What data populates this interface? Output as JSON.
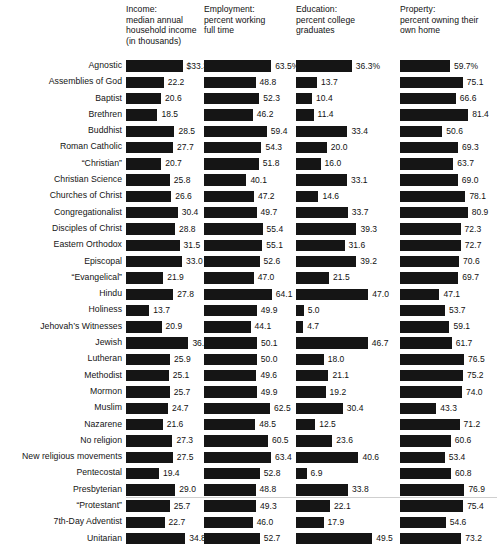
{
  "chart_data": {
    "type": "bar",
    "title": "",
    "subtitle": "",
    "orientation": "horizontal",
    "grid": false,
    "legend": false,
    "xlabel": "",
    "ylabel": "",
    "categories": [
      "Agnostic",
      "Assemblies of God",
      "Baptist",
      "Brethren",
      "Buddhist",
      "Roman Catholic",
      "“Christian”",
      "Christian Science",
      "Churches of Christ",
      "Congregationalist",
      "Disciples of Christ",
      "Eastern Orthodox",
      "Episcopal",
      "“Evangelical”",
      "Hindu",
      "Holiness",
      "Jehovah’s Witnesses",
      "Jewish",
      "Lutheran",
      "Methodist",
      "Mormon",
      "Muslim",
      "Nazarene",
      "No religion",
      "New religious movements",
      "Pentecostal",
      "Presbyterian",
      "“Protestant”",
      "7th-Day Adventist",
      "Unitarian"
    ],
    "panels": [
      {
        "key": "income",
        "header": "Income:\nmedian annual\nhousehold income\n(in thousands)",
        "header_lines": [
          "Income:",
          "median annual",
          "household income",
          "(in thousands)"
        ],
        "unit_prefix": "$",
        "axis_max": 40.0,
        "bar_px_max": 68,
        "labels": [
          "$33.3",
          "22.2",
          "20.6",
          "18.5",
          "28.5",
          "27.7",
          "20.7",
          "25.8",
          "26.6",
          "30.4",
          "28.8",
          "31.5",
          "33.0",
          "21.9",
          "27.8",
          "13.7",
          "20.9",
          "36.7",
          "25.9",
          "25.1",
          "25.7",
          "24.7",
          "21.6",
          "27.3",
          "27.5",
          "19.4",
          "29.0",
          "25.7",
          "22.7",
          "34.8"
        ],
        "values": [
          33.3,
          22.2,
          20.6,
          18.5,
          28.5,
          27.7,
          20.7,
          25.8,
          26.6,
          30.4,
          28.8,
          31.5,
          33.0,
          21.9,
          27.8,
          13.7,
          20.9,
          36.7,
          25.9,
          25.1,
          25.7,
          24.7,
          21.6,
          27.3,
          27.5,
          19.4,
          29.0,
          25.7,
          22.7,
          34.8
        ]
      },
      {
        "key": "employment",
        "header": "Employment:\npercent working\nfull time",
        "header_lines": [
          "Employment:",
          "percent working",
          "full time"
        ],
        "unit_prefix": "",
        "axis_max": 70.0,
        "bar_px_max": 74,
        "labels": [
          "63.5%",
          "48.8",
          "52.3",
          "46.2",
          "59.4",
          "54.3",
          "51.8",
          "40.1",
          "47.2",
          "49.7",
          "55.4",
          "55.1",
          "52.6",
          "47.0",
          "64.1",
          "49.9",
          "44.1",
          "50.1",
          "50.0",
          "49.6",
          "49.9",
          "62.5",
          "48.5",
          "60.5",
          "63.4",
          "52.8",
          "48.8",
          "49.3",
          "46.0",
          "52.7"
        ],
        "values": [
          63.5,
          48.8,
          52.3,
          46.2,
          59.4,
          54.3,
          51.8,
          40.1,
          47.2,
          49.7,
          55.4,
          55.1,
          52.6,
          47.0,
          64.1,
          49.9,
          44.1,
          50.1,
          50.0,
          49.6,
          49.9,
          62.5,
          48.5,
          60.5,
          63.4,
          52.8,
          48.8,
          49.3,
          46.0,
          52.7
        ]
      },
      {
        "key": "education",
        "header": "Education:\npercent college\ngraduates",
        "header_lines": [
          "Education:",
          "percent college",
          "graduates"
        ],
        "unit_prefix": "",
        "axis_max": 52.0,
        "bar_px_max": 80,
        "labels": [
          "36.3%",
          "13.7",
          "10.4",
          "11.4",
          "33.4",
          "20.0",
          "16.0",
          "33.1",
          "14.6",
          "33.7",
          "39.3",
          "31.6",
          "39.2",
          "21.5",
          "47.0",
          "5.0",
          "4.7",
          "46.7",
          "18.0",
          "21.1",
          "19.2",
          "30.4",
          "12.5",
          "23.6",
          "40.6",
          "6.9",
          "33.8",
          "22.1",
          "17.9",
          "49.5"
        ],
        "values": [
          36.3,
          13.7,
          10.4,
          11.4,
          33.4,
          20.0,
          16.0,
          33.1,
          14.6,
          33.7,
          39.3,
          31.6,
          39.2,
          21.5,
          47.0,
          5.0,
          4.7,
          46.7,
          18.0,
          21.1,
          19.2,
          30.4,
          12.5,
          23.6,
          40.6,
          6.9,
          33.8,
          22.1,
          17.9,
          49.5
        ]
      },
      {
        "key": "property",
        "header": "Property:\npercent owning their\nown home",
        "header_lines": [
          "Property:",
          "percent owning their",
          "own home"
        ],
        "unit_prefix": "",
        "axis_max": 86.0,
        "bar_px_max": 72,
        "labels": [
          "59.7%",
          "75.1",
          "66.6",
          "81.4",
          "50.6",
          "69.3",
          "63.7",
          "69.0",
          "78.1",
          "80.9",
          "72.3",
          "72.7",
          "70.6",
          "69.7",
          "47.1",
          "53.7",
          "59.1",
          "61.7",
          "76.5",
          "75.2",
          "74.0",
          "43.3",
          "71.2",
          "60.6",
          "53.4",
          "60.8",
          "76.9",
          "75.4",
          "54.6",
          "73.2"
        ],
        "values": [
          59.7,
          75.1,
          66.6,
          81.4,
          50.6,
          69.3,
          63.7,
          69.0,
          78.1,
          80.9,
          72.3,
          72.7,
          70.6,
          69.7,
          47.1,
          53.7,
          59.1,
          61.7,
          76.5,
          75.2,
          74.0,
          43.3,
          71.2,
          60.6,
          53.4,
          60.8,
          76.9,
          75.4,
          54.6,
          73.2
        ]
      }
    ]
  }
}
